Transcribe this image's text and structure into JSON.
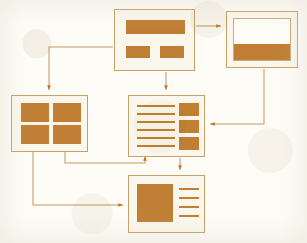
{
  "diagram": {
    "type": "sitemap-flow",
    "background_color": "#fdfcf7",
    "accent_color": "#c07f35",
    "outline_color": "#c8a06a",
    "panel_fill": "#fbf7ec",
    "connector_color": "#c79a62",
    "nodes": [
      {
        "id": "top-center",
        "name": "home-page-wireframe",
        "label": "",
        "x": 114,
        "y": 9,
        "w": 81,
        "h": 62,
        "kind": "banner-plus-two-tiles",
        "elements": [
          {
            "name": "hero-banner-block",
            "x": 11,
            "y": 10,
            "w": 59,
            "h": 14
          },
          {
            "name": "left-tile-block",
            "x": 11,
            "y": 36,
            "w": 24,
            "h": 12
          },
          {
            "name": "right-tile-block",
            "x": 45,
            "y": 36,
            "w": 24,
            "h": 12
          }
        ]
      },
      {
        "id": "top-right",
        "name": "browser-window-wireframe",
        "label": "",
        "x": 226,
        "y": 11,
        "w": 72,
        "h": 57,
        "kind": "browser-window",
        "elements": [
          {
            "name": "viewport-area",
            "x": 7,
            "y": 7,
            "w": 58,
            "h": 42
          },
          {
            "name": "footer-band-block",
            "x": 8,
            "y": 33,
            "w": 56,
            "h": 15
          }
        ]
      },
      {
        "id": "left",
        "name": "gallery-grid-wireframe",
        "label": "",
        "x": 11,
        "y": 95,
        "w": 77,
        "h": 57,
        "kind": "two-by-two-grid",
        "elements": [
          {
            "name": "grid-cell-top-left",
            "x": 9,
            "y": 8,
            "w": 28,
            "h": 19
          },
          {
            "name": "grid-cell-top-right",
            "x": 42,
            "y": 8,
            "w": 28,
            "h": 19
          },
          {
            "name": "grid-cell-bottom-left",
            "x": 9,
            "y": 31,
            "w": 28,
            "h": 19
          },
          {
            "name": "grid-cell-bottom-right",
            "x": 42,
            "y": 31,
            "w": 28,
            "h": 19
          }
        ]
      },
      {
        "id": "center",
        "name": "article-list-wireframe",
        "label": "",
        "x": 128,
        "y": 95,
        "w": 77,
        "h": 62,
        "kind": "text-lines-plus-sidebar-tiles",
        "text_lines": 6,
        "elements": [
          {
            "name": "text-line",
            "x": 8,
            "y": 9,
            "w": 38,
            "h": 2.6
          },
          {
            "name": "text-line",
            "x": 8,
            "y": 17,
            "w": 38,
            "h": 2.6
          },
          {
            "name": "text-line",
            "x": 8,
            "y": 25,
            "w": 38,
            "h": 2.6
          },
          {
            "name": "text-line",
            "x": 8,
            "y": 33,
            "w": 38,
            "h": 2.6
          },
          {
            "name": "text-line",
            "x": 8,
            "y": 41,
            "w": 38,
            "h": 2.6
          },
          {
            "name": "text-line",
            "x": 8,
            "y": 49,
            "w": 38,
            "h": 2.6
          },
          {
            "name": "sidebar-tile-1",
            "x": 50,
            "y": 8,
            "w": 20,
            "h": 13
          },
          {
            "name": "sidebar-tile-2",
            "x": 50,
            "y": 25,
            "w": 20,
            "h": 13
          },
          {
            "name": "sidebar-tile-3",
            "x": 50,
            "y": 42,
            "w": 20,
            "h": 13
          }
        ]
      },
      {
        "id": "bottom",
        "name": "detail-page-wireframe",
        "label": "",
        "x": 128,
        "y": 175,
        "w": 77,
        "h": 58,
        "kind": "image-plus-text-lines",
        "text_lines": 4,
        "elements": [
          {
            "name": "feature-image-block",
            "x": 8,
            "y": 8,
            "w": 35,
            "h": 38
          },
          {
            "name": "text-line",
            "x": 50,
            "y": 12,
            "w": 20,
            "h": 2.6
          },
          {
            "name": "text-line",
            "x": 50,
            "y": 21,
            "w": 20,
            "h": 2.6
          },
          {
            "name": "text-line",
            "x": 50,
            "y": 30,
            "w": 20,
            "h": 2.6
          },
          {
            "name": "text-line",
            "x": 50,
            "y": 39,
            "w": 20,
            "h": 2.6
          }
        ]
      }
    ],
    "connectors": [
      {
        "name": "connector-home-to-browser",
        "from": "top-center",
        "to": "top-right",
        "path": "M 196 26 L 223 26",
        "arrow_at": [
          223,
          26
        ],
        "arrow_dir": "right"
      },
      {
        "name": "connector-home-to-gallery",
        "from": "top-center",
        "to": "left",
        "path": "M 113 47 L 49 47 L 49 92",
        "arrow_at": [
          49,
          92
        ],
        "arrow_dir": "down"
      },
      {
        "name": "connector-home-to-article-list",
        "from": "top-center",
        "to": "center",
        "path": "M 166 72 L 166 92",
        "arrow_at": [
          166,
          92
        ],
        "arrow_dir": "down"
      },
      {
        "name": "connector-browser-to-article-list",
        "from": "top-right",
        "to": "center",
        "path": "M 264 69 L 264 124 L 208 124",
        "arrow_at": [
          208,
          124
        ],
        "arrow_dir": "left"
      },
      {
        "name": "connector-gallery-to-article-list",
        "from": "left",
        "to": "center",
        "path": "M 65 152 L 65 163 L 145 163 L 145 154",
        "arrow_at": [
          145,
          154
        ],
        "arrow_dir": "up"
      },
      {
        "name": "connector-gallery-to-detail",
        "from": "left",
        "to": "bottom",
        "path": "M 33 152 L 33 205 L 125 205",
        "arrow_at": [
          125,
          205
        ],
        "arrow_dir": "right"
      },
      {
        "name": "connector-article-list-to-detail",
        "from": "center",
        "to": "bottom",
        "path": "M 180 158 L 180 172",
        "arrow_at": [
          180,
          172
        ],
        "arrow_dir": "down"
      }
    ]
  }
}
